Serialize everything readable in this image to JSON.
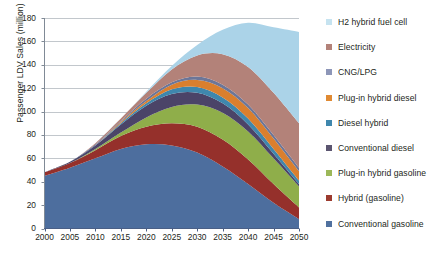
{
  "chart_data": {
    "type": "area",
    "stacked": true,
    "title": "",
    "xlabel": "",
    "ylabel": "Passenger LDV Sales (million)",
    "xlim": [
      2000,
      2050
    ],
    "ylim": [
      0,
      180
    ],
    "ytick_step": 20,
    "xtick_step": 5,
    "grid": true,
    "grid_axis": "y",
    "legend_position": "right",
    "x": [
      2000,
      2005,
      2010,
      2015,
      2020,
      2025,
      2030,
      2035,
      2040,
      2045,
      2050
    ],
    "xticklabels": [
      "2000",
      "2005",
      "2010",
      "2015",
      "2020",
      "2025",
      "2030",
      "2035",
      "2040",
      "2045",
      "2050"
    ],
    "yticklabels": [
      "0",
      "20",
      "40",
      "60",
      "80",
      "100",
      "120",
      "140",
      "160",
      "180"
    ],
    "series": [
      {
        "name": "Conventional gasoline",
        "color": "#4d6e9e",
        "stack_order": 1,
        "values": [
          45,
          52,
          60,
          68,
          72,
          71,
          65,
          53,
          38,
          22,
          8
        ]
      },
      {
        "name": "Hybrid (gasoline)",
        "color": "#95302b",
        "stack_order": 2,
        "values": [
          3,
          4,
          7,
          11,
          15,
          19,
          22,
          23,
          21,
          16,
          10
        ]
      },
      {
        "name": "Plug-in hybrid gasoline",
        "color": "#8fae4a",
        "stack_order": 3,
        "values": [
          0,
          0,
          1,
          3,
          8,
          14,
          19,
          23,
          24,
          22,
          18
        ]
      },
      {
        "name": "Conventional diesel",
        "color": "#4b4468",
        "stack_order": 4,
        "values": [
          0,
          1,
          3,
          7,
          10,
          11,
          10,
          8,
          6,
          4,
          2
        ]
      },
      {
        "name": "Diesel hybrid",
        "color": "#3f87ad",
        "stack_order": 5,
        "values": [
          0,
          0,
          0,
          1,
          2,
          4,
          5,
          5,
          5,
          4,
          3
        ]
      },
      {
        "name": "Plug-in hybrid diesel",
        "color": "#da7f2e",
        "stack_order": 6,
        "values": [
          0,
          0,
          0,
          1,
          2,
          4,
          6,
          8,
          9,
          9,
          8
        ]
      },
      {
        "name": "CNG/LPG",
        "color": "#6c7698",
        "stack_order": 7,
        "values": [
          0,
          0,
          1,
          1,
          2,
          2,
          3,
          3,
          3,
          3,
          3
        ]
      },
      {
        "name": "Electricity",
        "color": "#b38279",
        "stack_order": 8,
        "values": [
          0,
          0,
          1,
          2,
          5,
          11,
          18,
          26,
          32,
          36,
          38
        ]
      },
      {
        "name": "H2 hybrid fuel cell",
        "color": "#abd3e8",
        "stack_order": 9,
        "values": [
          0,
          0,
          0,
          0,
          1,
          3,
          9,
          21,
          38,
          56,
          78
        ]
      }
    ],
    "totals": [
      48,
      57,
      73,
      94,
      117,
      139,
      157,
      170,
      176,
      172,
      168
    ]
  },
  "legend": {
    "items": [
      {
        "label": "H2 hybrid fuel cell",
        "color": "#c6e3f0"
      },
      {
        "label": "Electricity",
        "color": "#b38279"
      },
      {
        "label": "CNG/LPG",
        "color": "#8d96b8"
      },
      {
        "label": "Plug-in hybrid diesel",
        "color": "#e08a33"
      },
      {
        "label": "Diesel hybrid",
        "color": "#3f87ad"
      },
      {
        "label": "Conventional diesel",
        "color": "#5b5570"
      },
      {
        "label": "Plug-in hybrid gasoline",
        "color": "#9cb859"
      },
      {
        "label": "Hybrid (gasoline)",
        "color": "#9c3b2f"
      },
      {
        "label": "Conventional gasoline",
        "color": "#50719f"
      }
    ]
  },
  "axes": {
    "y_title": "Passenger LDV Sales (million)",
    "y_ticks": [
      "180",
      "160",
      "140",
      "120",
      "100",
      "80",
      "60",
      "40",
      "20",
      "0"
    ],
    "x_ticks": [
      "2000",
      "2005",
      "2010",
      "2015",
      "2020",
      "2025",
      "2030",
      "2035",
      "2040",
      "2045",
      "2050"
    ]
  }
}
